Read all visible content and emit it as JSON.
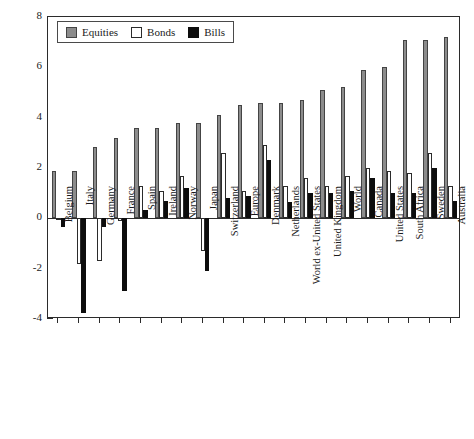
{
  "chart_data": {
    "type": "bar",
    "title": "",
    "xlabel": "",
    "ylabel": "Return (%)",
    "ylim": [
      -4,
      8
    ],
    "yticks": [
      -4,
      -2,
      0,
      2,
      4,
      6,
      8
    ],
    "ytick_labels": [
      "-4",
      "-2",
      "0",
      "2",
      "4",
      "6",
      "8"
    ],
    "grid": false,
    "legend_position": "top-left",
    "categories": [
      "Belgium",
      "Italy",
      "Germany",
      "France",
      "Spain",
      "Ireland",
      "Norway",
      "Japan",
      "Switzerland",
      "Europe",
      "Denmark",
      "Netherlands",
      "World ex-United States",
      "United Kingdom",
      "World",
      "Canada",
      "United States",
      "South Africa",
      "Sweden",
      "Australia"
    ],
    "series": [
      {
        "name": "Equities",
        "color": "#8c8c8c",
        "values": [
          1.9,
          1.9,
          2.85,
          3.2,
          3.6,
          3.6,
          3.8,
          3.8,
          4.1,
          4.5,
          4.6,
          4.6,
          4.7,
          5.1,
          5.2,
          5.9,
          6.0,
          7.1,
          7.1,
          7.2
        ]
      },
      {
        "name": "Bonds",
        "color": "#ffffff",
        "values": [
          -0.05,
          -1.8,
          -1.7,
          -0.1,
          1.3,
          1.1,
          1.7,
          -1.3,
          2.6,
          1.1,
          2.9,
          1.3,
          1.6,
          1.3,
          1.7,
          2.0,
          1.9,
          1.8,
          2.6,
          1.3
        ]
      },
      {
        "name": "Bills",
        "color": "#0d0d0d",
        "values": [
          -0.35,
          -3.75,
          -0.35,
          -2.9,
          0.35,
          0.7,
          1.2,
          -2.1,
          0.8,
          0.9,
          2.3,
          0.65,
          1.0,
          1.0,
          1.1,
          1.6,
          1.0,
          1.0,
          2.0,
          0.7
        ]
      }
    ]
  },
  "legend": {
    "items": [
      {
        "label": "Equities",
        "key": "equities"
      },
      {
        "label": "Bonds",
        "key": "bonds"
      },
      {
        "label": "Bills",
        "key": "bills"
      }
    ]
  }
}
